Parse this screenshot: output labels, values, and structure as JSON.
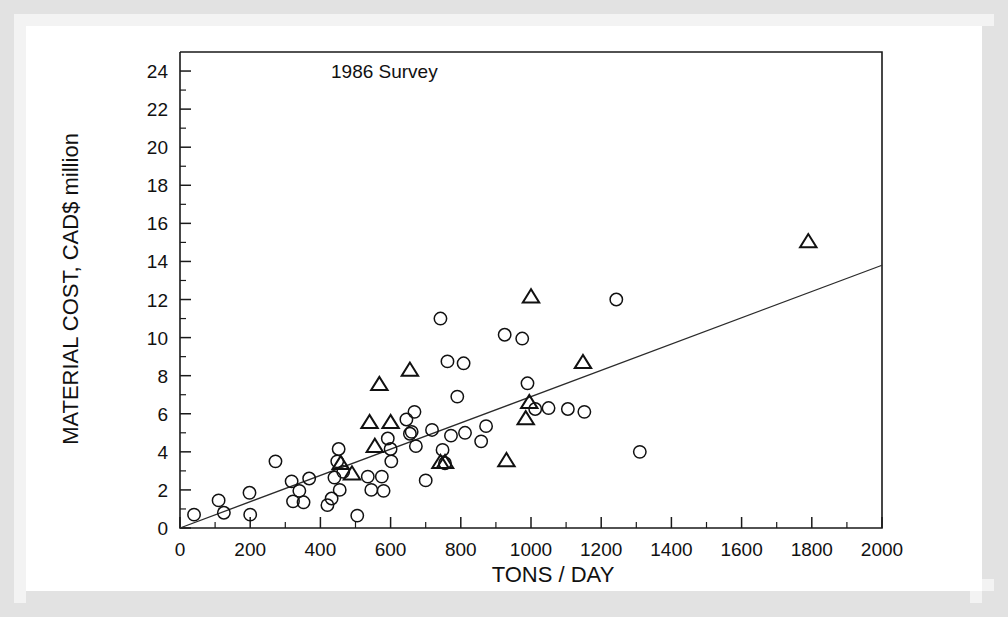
{
  "chart_data": {
    "type": "scatter",
    "title": "",
    "annotation": "1986 Survey",
    "xlabel": "TONS / DAY",
    "ylabel": "MATERIAL COST, CAD$ million",
    "xlim": [
      0,
      2000
    ],
    "ylim": [
      0,
      25
    ],
    "x_ticks": [
      0,
      200,
      400,
      600,
      800,
      1000,
      1200,
      1400,
      1600,
      1800,
      2000
    ],
    "y_ticks": [
      0,
      2,
      4,
      6,
      8,
      10,
      12,
      14,
      16,
      18,
      20,
      22,
      24
    ],
    "x_minor_step": 100,
    "y_minor_step": 1,
    "grid": false,
    "legend": "none",
    "series": [
      {
        "name": "circles",
        "marker": "open-circle",
        "points": [
          [
            40,
            0.7
          ],
          [
            110,
            1.45
          ],
          [
            125,
            0.8
          ],
          [
            198,
            1.85
          ],
          [
            200,
            0.7
          ],
          [
            272,
            3.5
          ],
          [
            318,
            2.45
          ],
          [
            322,
            1.4
          ],
          [
            340,
            1.95
          ],
          [
            352,
            1.35
          ],
          [
            368,
            2.6
          ],
          [
            420,
            1.2
          ],
          [
            432,
            1.55
          ],
          [
            440,
            2.65
          ],
          [
            448,
            3.5
          ],
          [
            452,
            4.15
          ],
          [
            455,
            2.0
          ],
          [
            465,
            2.95
          ],
          [
            505,
            0.65
          ],
          [
            535,
            2.7
          ],
          [
            545,
            2.0
          ],
          [
            575,
            2.7
          ],
          [
            580,
            1.95
          ],
          [
            592,
            4.7
          ],
          [
            600,
            4.15
          ],
          [
            602,
            3.5
          ],
          [
            645,
            5.7
          ],
          [
            655,
            4.95
          ],
          [
            660,
            5.05
          ],
          [
            668,
            6.1
          ],
          [
            672,
            4.3
          ],
          [
            700,
            2.5
          ],
          [
            718,
            5.15
          ],
          [
            742,
            11.0
          ],
          [
            748,
            4.1
          ],
          [
            755,
            3.4
          ],
          [
            762,
            8.75
          ],
          [
            772,
            4.85
          ],
          [
            790,
            6.9
          ],
          [
            808,
            8.65
          ],
          [
            812,
            5.0
          ],
          [
            858,
            4.55
          ],
          [
            872,
            5.35
          ],
          [
            925,
            10.15
          ],
          [
            975,
            9.95
          ],
          [
            990,
            7.6
          ],
          [
            1012,
            6.25
          ],
          [
            1050,
            6.3
          ],
          [
            1105,
            6.25
          ],
          [
            1152,
            6.1
          ],
          [
            1243,
            12.0
          ],
          [
            1310,
            4.0
          ]
        ]
      },
      {
        "name": "triangles",
        "marker": "open-triangle",
        "points": [
          [
            458,
            3.4
          ],
          [
            490,
            2.85
          ],
          [
            540,
            5.55
          ],
          [
            555,
            4.3
          ],
          [
            568,
            7.55
          ],
          [
            600,
            5.55
          ],
          [
            655,
            8.3
          ],
          [
            742,
            3.45
          ],
          [
            755,
            3.45
          ],
          [
            930,
            3.55
          ],
          [
            985,
            5.75
          ],
          [
            995,
            6.6
          ],
          [
            1000,
            12.15
          ],
          [
            1148,
            8.7
          ],
          [
            1790,
            15.05
          ]
        ]
      }
    ],
    "trend_line": {
      "name": "regression-line",
      "x_start": 0,
      "y_start": 0,
      "x_end": 2000,
      "y_end": 13.8
    }
  },
  "colors": {
    "axis": "#1a1a1a",
    "marker": "#111111",
    "trend": "#2b2b2b",
    "plot_background": "#ffffff",
    "border_band": "#e2e2e2"
  }
}
